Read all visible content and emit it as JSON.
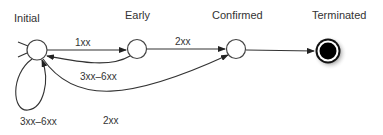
{
  "diagram": {
    "type": "state-machine",
    "states": [
      {
        "id": "initial",
        "label": "Initial",
        "kind": "normal"
      },
      {
        "id": "early",
        "label": "Early",
        "kind": "normal"
      },
      {
        "id": "confirmed",
        "label": "Confirmed",
        "kind": "normal"
      },
      {
        "id": "terminated",
        "label": "Terminated",
        "kind": "final"
      }
    ],
    "transitions": [
      {
        "id": "initial-early",
        "from": "initial",
        "to": "early",
        "label": "1xx"
      },
      {
        "id": "early-initial",
        "from": "early",
        "to": "initial",
        "label": "3xx–6xx"
      },
      {
        "id": "early-confirmed",
        "from": "early",
        "to": "confirmed",
        "label": "2xx"
      },
      {
        "id": "initial-self",
        "from": "initial",
        "to": "initial",
        "label": "3xx–6xx"
      },
      {
        "id": "initial-confirmed",
        "from": "initial",
        "to": "confirmed",
        "label": "2xx"
      },
      {
        "id": "confirmed-terminated",
        "from": "confirmed",
        "to": "terminated",
        "label": ""
      }
    ]
  }
}
